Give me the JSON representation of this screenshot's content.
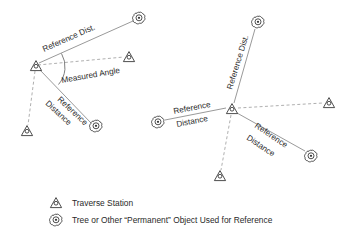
{
  "figure": {
    "title": "",
    "background_color": "#ffffff",
    "line_color": "#9a9a9a",
    "symbol_color": "#3a3a3a",
    "text_color": "#2a2a2a"
  },
  "labels": {
    "reference_dist_abbrev": "Reference Dist.",
    "measured_angle": "Measured Angle",
    "reference_word": "Reference",
    "distance_word": "Distance"
  },
  "legend": {
    "items": [
      {
        "symbol": "triangle-station-icon",
        "label": "Traverse Station"
      },
      {
        "symbol": "tree-reference-icon",
        "label": "Tree or Other “Permanent” Object Used for Reference"
      }
    ]
  },
  "left_diagram": {
    "name": "single-tie-traverse-station-diagram",
    "stations": [
      {
        "id": "center",
        "x": 36,
        "y": 66
      },
      {
        "id": "east",
        "x": 129,
        "y": 57
      },
      {
        "id": "southwest",
        "x": 27,
        "y": 131
      }
    ],
    "trees": [
      {
        "id": "upper-right-tree",
        "x": 139,
        "y": 18
      },
      {
        "id": "lower-right-tree",
        "x": 96,
        "y": 126
      }
    ],
    "traverse_legs": [
      {
        "from": "center",
        "to": "east",
        "style": "dashed"
      },
      {
        "from": "center",
        "to": "southwest",
        "style": "dashed"
      }
    ],
    "reference_distances": [
      {
        "from": "center",
        "to": "upper-right-tree",
        "style": "solid",
        "label": "Reference Dist."
      },
      {
        "from": "center",
        "to": "lower-right-tree",
        "style": "solid",
        "label": "Reference Distance"
      }
    ],
    "angle": {
      "at": "center",
      "label": "Measured Angle"
    },
    "label_positions": {
      "reference_dist_abbrev": {
        "x": 44,
        "y": 52,
        "rotation": -24
      },
      "measured_angle": {
        "x": 62,
        "y": 83,
        "rotation": -10
      },
      "reference_word": {
        "x": 58,
        "y": 101,
        "rotation": 42
      },
      "distance_word": {
        "x": 46,
        "y": 105,
        "rotation": 42
      }
    }
  },
  "right_diagram": {
    "name": "multi-tie-traverse-station-diagram",
    "stations": [
      {
        "id": "center",
        "x": 232,
        "y": 109
      },
      {
        "id": "east",
        "x": 329,
        "y": 103
      },
      {
        "id": "south",
        "x": 220,
        "y": 176
      }
    ],
    "trees": [
      {
        "id": "north-tree",
        "x": 258,
        "y": 22
      },
      {
        "id": "west-tree",
        "x": 158,
        "y": 122
      },
      {
        "id": "southeast-tree",
        "x": 311,
        "y": 156
      }
    ],
    "traverse_legs": [
      {
        "from": "center",
        "to": "east",
        "style": "dashed"
      },
      {
        "from": "center",
        "to": "south",
        "style": "dashed"
      }
    ],
    "reference_distances": [
      {
        "from": "center",
        "to": "north-tree",
        "style": "solid",
        "label": "Reference Dist."
      },
      {
        "from": "center",
        "to": "west-tree",
        "style": "solid",
        "label": "Reference Distance"
      },
      {
        "from": "center",
        "to": "southeast-tree",
        "style": "solid",
        "label": "Reference Distance"
      }
    ],
    "label_positions": {
      "reference_dist_abbrev": {
        "x": 232,
        "y": 88,
        "rotation": -73
      },
      "reference_word_west": {
        "x": 175,
        "y": 113,
        "rotation": -12
      },
      "distance_word_west": {
        "x": 178,
        "y": 126,
        "rotation": -12
      },
      "reference_word_se": {
        "x": 255,
        "y": 128,
        "rotation": 33
      },
      "distance_word_se": {
        "x": 247,
        "y": 140,
        "rotation": 33
      }
    }
  }
}
